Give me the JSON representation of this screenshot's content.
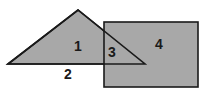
{
  "figure": {
    "title": "Overlapping triangle and rectangle region diagram",
    "canvas": {
      "width": 207,
      "height": 94
    },
    "colors": {
      "background": "#ffffff",
      "fill": "#a8a8a8",
      "stroke": "#1a1a1a",
      "label": "#1a1a1a"
    },
    "shapes": {
      "triangle": {
        "name": "triangle",
        "points": "8,64 78,10 145,64",
        "vertices": [
          {
            "x": 8,
            "y": 64
          },
          {
            "x": 78,
            "y": 10
          },
          {
            "x": 145,
            "y": 64
          }
        ]
      },
      "rectangle": {
        "name": "rectangle",
        "x": 104,
        "y": 22,
        "width": 94,
        "height": 65
      }
    },
    "labels": [
      {
        "id": "region-1",
        "text": "1",
        "x": 78,
        "y": 47
      },
      {
        "id": "region-2",
        "text": "2",
        "x": 68,
        "y": 75
      },
      {
        "id": "region-3",
        "text": "3",
        "x": 112,
        "y": 53
      },
      {
        "id": "region-4",
        "text": "4",
        "x": 159,
        "y": 45
      }
    ]
  }
}
